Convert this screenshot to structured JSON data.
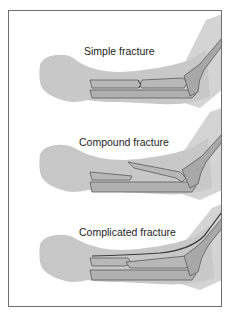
{
  "diagram": {
    "panels": [
      {
        "id": "simple",
        "label": "Simple fracture"
      },
      {
        "id": "compound",
        "label": "Compound fracture"
      },
      {
        "id": "complicated",
        "label": "Complicated fracture"
      }
    ],
    "colors": {
      "frame_border": "#6e6e6e",
      "skin": "#c8c8c8",
      "skin_light": "#d6d6d6",
      "bone": "#b4b4b4",
      "bone_outline": "#5a5a5a",
      "vessel": "#3a3a3a",
      "text": "#1e1e1e"
    }
  }
}
